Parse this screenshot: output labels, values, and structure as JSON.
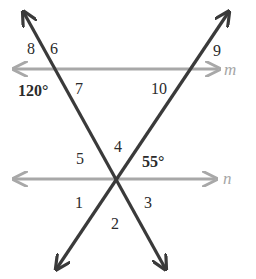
{
  "diagram": {
    "type": "parallel-lines-cut-by-transversals",
    "colors": {
      "background": "#ffffff",
      "parallel_line": "#a8a8a8",
      "transversal": "#3a3a3a",
      "label": "#2b2b2b",
      "line_name": "#a6a6a6"
    },
    "parallel_lines": [
      {
        "name": "m",
        "y": 69,
        "x1": 15,
        "x2": 218
      },
      {
        "name": "n",
        "y": 179,
        "x1": 15,
        "x2": 215
      }
    ],
    "transversals": [
      {
        "id": "t1",
        "from": [
          24,
          13
        ],
        "to": [
          165,
          268
        ]
      },
      {
        "id": "t2",
        "from": [
          228,
          13
        ],
        "to": [
          57,
          268
        ]
      }
    ],
    "intersection_point": [
      117,
      179
    ],
    "angle_labels": [
      {
        "id": "8",
        "text": "8",
        "x": 27,
        "y": 54
      },
      {
        "id": "6",
        "text": "6",
        "x": 50,
        "y": 54
      },
      {
        "id": "120",
        "text": "120°",
        "x": 18,
        "y": 96,
        "bold": true
      },
      {
        "id": "7",
        "text": "7",
        "x": 75,
        "y": 94
      },
      {
        "id": "9",
        "text": "9",
        "x": 213,
        "y": 56
      },
      {
        "id": "10",
        "text": "10",
        "x": 151,
        "y": 94
      },
      {
        "id": "5",
        "text": "5",
        "x": 76,
        "y": 164
      },
      {
        "id": "4",
        "text": "4",
        "x": 114,
        "y": 152
      },
      {
        "id": "55",
        "text": "55°",
        "x": 142,
        "y": 167,
        "bold": true
      },
      {
        "id": "1",
        "text": "1",
        "x": 75,
        "y": 208
      },
      {
        "id": "3",
        "text": "3",
        "x": 144,
        "y": 208
      },
      {
        "id": "2",
        "text": "2",
        "x": 111,
        "y": 229
      }
    ],
    "line_name_labels": [
      {
        "text": "m",
        "x": 224,
        "y": 75
      },
      {
        "text": "n",
        "x": 223,
        "y": 184
      }
    ]
  }
}
